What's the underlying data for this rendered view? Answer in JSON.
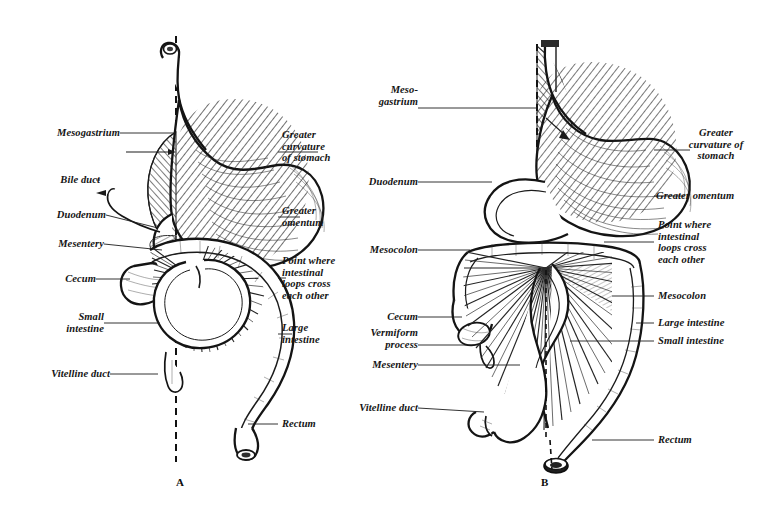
{
  "figure": {
    "style": "black-and-white engraving, two panels",
    "panels": [
      {
        "id": "A",
        "caption": "A",
        "labels_left": [
          {
            "text": "Mesogastrium",
            "lines": [
              "Mesogastrium"
            ]
          },
          {
            "text": "Bile duct",
            "lines": [
              "Bile duct"
            ]
          },
          {
            "text": "Duodenum",
            "lines": [
              "Duodenum"
            ]
          },
          {
            "text": "Mesentery",
            "lines": [
              "Mesentery"
            ]
          },
          {
            "text": "Cecum",
            "lines": [
              "Cecum"
            ]
          },
          {
            "text": "Small intestine",
            "lines": [
              "Small",
              "intestine"
            ]
          },
          {
            "text": "Vitelline duct",
            "lines": [
              "Vitelline duct"
            ]
          }
        ],
        "labels_right": [
          {
            "text": "Greater curvature of stomach",
            "lines": [
              "Greater",
              "curvature",
              "of stomach"
            ]
          },
          {
            "text": "Greater omentum",
            "lines": [
              "Greater",
              "omentum"
            ]
          },
          {
            "text": "Point where intestinal loops cross each other",
            "lines": [
              "Point where",
              "intestinal",
              "loops cross",
              "each other"
            ]
          },
          {
            "text": "Large intestine",
            "lines": [
              "Large",
              "intestine"
            ]
          },
          {
            "text": "Rectum",
            "lines": [
              "Rectum"
            ]
          }
        ]
      },
      {
        "id": "B",
        "caption": "B",
        "labels_left": [
          {
            "text": "Mesogastrium",
            "lines": [
              "Meso-",
              "gastrium"
            ]
          },
          {
            "text": "Duodenum",
            "lines": [
              "Duodenum"
            ]
          },
          {
            "text": "Mesocolon",
            "lines": [
              "Mesocolon"
            ]
          },
          {
            "text": "Cecum",
            "lines": [
              "Cecum"
            ]
          },
          {
            "text": "Vermiform process",
            "lines": [
              "Vermiform",
              "process"
            ]
          },
          {
            "text": "Mesentery",
            "lines": [
              "Mesentery"
            ]
          },
          {
            "text": "Vitelline duct",
            "lines": [
              "Vitelline duct"
            ]
          }
        ],
        "labels_right": [
          {
            "text": "Greater curvature of stomach",
            "lines": [
              "Greater",
              "curvature of",
              "stomach"
            ]
          },
          {
            "text": "Greater omentum",
            "lines": [
              "Greater omentum"
            ]
          },
          {
            "text": "Point where intestinal loops cross each other",
            "lines": [
              "Point where",
              "intestinal",
              "loops cross",
              "each other"
            ]
          },
          {
            "text": "Mesocolon",
            "lines": [
              "Mesocolon"
            ]
          },
          {
            "text": "Large intestine",
            "lines": [
              "Large intestine"
            ]
          },
          {
            "text": "Small intestine",
            "lines": [
              "Small intestine"
            ]
          },
          {
            "text": "Rectum",
            "lines": [
              "Rectum"
            ]
          }
        ]
      }
    ],
    "colors": {
      "ink": "#1b1b1b",
      "background": "#ffffff",
      "shading": "#8d8d8d"
    }
  },
  "labels": {
    "a_mesogastrium": "Mesogastrium",
    "a_bile_duct": "Bile duct",
    "a_duodenum": "Duodenum",
    "a_mesentery": "Mesentery",
    "a_cecum": "Cecum",
    "a_small_intestine": "Small\nintestine",
    "a_vitelline_duct": "Vitelline duct",
    "a_greater_curvature": "Greater\ncurvature\nof stomach",
    "a_greater_omentum": "Greater\nomentum",
    "a_point_where": "Point where\nintestinal\nloops cross\neach other",
    "a_large_intestine": "Large\nintestine",
    "a_rectum": "Rectum",
    "a_caption": "A",
    "b_mesogastrium": "Meso-\ngastrium",
    "b_duodenum": "Duodenum",
    "b_mesocolon_left": "Mesocolon",
    "b_cecum": "Cecum",
    "b_vermiform": "Vermiform\nprocess",
    "b_mesentery": "Mesentery",
    "b_vitelline_duct": "Vitelline duct",
    "b_greater_curvature": "Greater\ncurvature of\nstomach",
    "b_greater_omentum": "Greater omentum",
    "b_point_where": "Point where\nintestinal\nloops cross\neach other",
    "b_mesocolon_right": "Mesocolon",
    "b_large_intestine": "Large intestine",
    "b_small_intestine": "Small intestine",
    "b_rectum": "Rectum",
    "b_caption": "B"
  }
}
